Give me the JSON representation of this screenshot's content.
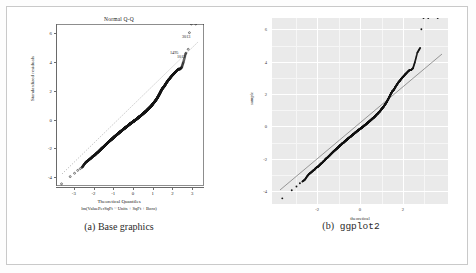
{
  "figure": {
    "panels": [
      {
        "id": "a",
        "caption_lead": "(a)",
        "caption_text": "Base graphics",
        "style": "base-r"
      },
      {
        "id": "b",
        "caption_lead": "(b)",
        "caption_text": "ggplot2",
        "style": "ggplot2"
      }
    ]
  },
  "chart_data": [
    {
      "type": "scatter",
      "panel": "a",
      "title": "Normal Q-Q",
      "xlabel": "Theoretical Quantiles",
      "sublabel": "lm(ValuePerSqFt ~ Units + SqFt + Boro)",
      "ylabel": "Standardized residuals",
      "xlim": [
        -3.9,
        3.6
      ],
      "ylim": [
        -4.6,
        6.6
      ],
      "xticks": [
        "-3",
        "-2",
        "-1",
        "0",
        "1",
        "2",
        "3"
      ],
      "xtick_values": [
        -3,
        -2,
        -1,
        0,
        1,
        2,
        3
      ],
      "yticks": [
        "-4",
        "-2",
        "0",
        "2",
        "4",
        "6"
      ],
      "ytick_values": [
        -4,
        -2,
        0,
        2,
        4,
        6
      ],
      "grid": false,
      "legend": "none",
      "reference_line": {
        "type": "qq-line",
        "style": "dotted",
        "slope": 1.0,
        "intercept": 0.0
      },
      "annotations": [
        {
          "label": "3013",
          "x": 3.15,
          "y": 6.0
        },
        {
          "label": "1495",
          "x": 2.98,
          "y": 4.85
        },
        {
          "label": "1012",
          "x": 2.86,
          "y": 4.55
        }
      ],
      "x": [
        -3.62,
        -3.18,
        -2.96,
        -2.8,
        -2.67,
        -2.56,
        -2.47,
        -2.38,
        -2.31,
        -2.24,
        -2.17,
        -2.11,
        -2.06,
        -2.0,
        -1.95,
        -1.9,
        -1.86,
        -1.81,
        -1.77,
        -1.73,
        -1.69,
        -1.65,
        -1.62,
        -1.58,
        -1.55,
        -1.51,
        -1.48,
        -1.45,
        -1.42,
        -1.39,
        -1.36,
        -1.33,
        -1.3,
        -1.27,
        -1.25,
        -1.22,
        -1.19,
        -1.17,
        -1.14,
        -1.11,
        -1.09,
        -1.06,
        -1.04,
        -1.01,
        -0.99,
        -0.97,
        -0.94,
        -0.92,
        -0.9,
        -0.87,
        -0.85,
        -0.83,
        -0.81,
        -0.78,
        -0.76,
        -0.74,
        -0.72,
        -0.7,
        -0.68,
        -0.66,
        -0.64,
        -0.61,
        -0.59,
        -0.57,
        -0.55,
        -0.53,
        -0.51,
        -0.49,
        -0.47,
        -0.45,
        -0.43,
        -0.41,
        -0.39,
        -0.37,
        -0.35,
        -0.33,
        -0.31,
        -0.29,
        -0.27,
        -0.25,
        -0.23,
        -0.21,
        -0.2,
        -0.18,
        -0.16,
        -0.14,
        -0.12,
        -0.1,
        -0.08,
        -0.06,
        -0.04,
        -0.02,
        0.0,
        0.02,
        0.04,
        0.06,
        0.08,
        0.1,
        0.12,
        0.14,
        0.16,
        0.18,
        0.2,
        0.21,
        0.23,
        0.25,
        0.27,
        0.29,
        0.31,
        0.33,
        0.35,
        0.37,
        0.39,
        0.41,
        0.43,
        0.45,
        0.47,
        0.49,
        0.51,
        0.53,
        0.55,
        0.57,
        0.59,
        0.61,
        0.64,
        0.66,
        0.68,
        0.7,
        0.72,
        0.74,
        0.76,
        0.78,
        0.81,
        0.83,
        0.85,
        0.87,
        0.9,
        0.92,
        0.94,
        0.97,
        0.99,
        1.01,
        1.04,
        1.06,
        1.09,
        1.11,
        1.14,
        1.17,
        1.19,
        1.22,
        1.25,
        1.27,
        1.3,
        1.33,
        1.36,
        1.39,
        1.42,
        1.45,
        1.48,
        1.51,
        1.55,
        1.58,
        1.62,
        1.65,
        1.69,
        1.73,
        1.77,
        1.81,
        1.86,
        1.9,
        1.95,
        2.0,
        2.06,
        2.11,
        2.17,
        2.24,
        2.31,
        2.38,
        2.47,
        2.56,
        2.67,
        2.8,
        2.86,
        2.96,
        3.18,
        3.62
      ],
      "y": [
        -4.45,
        -3.95,
        -3.72,
        -3.52,
        -3.4,
        -3.28,
        -3.1,
        -2.95,
        -2.88,
        -2.8,
        -2.72,
        -2.66,
        -2.58,
        -2.52,
        -2.48,
        -2.42,
        -2.36,
        -2.3,
        -2.26,
        -2.2,
        -2.15,
        -2.1,
        -2.05,
        -2.0,
        -1.96,
        -1.92,
        -1.88,
        -1.84,
        -1.8,
        -1.76,
        -1.72,
        -1.68,
        -1.64,
        -1.6,
        -1.57,
        -1.54,
        -1.5,
        -1.47,
        -1.44,
        -1.41,
        -1.38,
        -1.35,
        -1.32,
        -1.29,
        -1.26,
        -1.23,
        -1.2,
        -1.17,
        -1.15,
        -1.12,
        -1.09,
        -1.07,
        -1.04,
        -1.02,
        -0.99,
        -0.97,
        -0.94,
        -0.92,
        -0.89,
        -0.87,
        -0.85,
        -0.82,
        -0.8,
        -0.77,
        -0.75,
        -0.73,
        -0.71,
        -0.68,
        -0.66,
        -0.64,
        -0.62,
        -0.6,
        -0.57,
        -0.55,
        -0.53,
        -0.51,
        -0.49,
        -0.47,
        -0.45,
        -0.42,
        -0.4,
        -0.38,
        -0.36,
        -0.34,
        -0.32,
        -0.3,
        -0.28,
        -0.26,
        -0.24,
        -0.22,
        -0.2,
        -0.18,
        -0.16,
        -0.14,
        -0.12,
        -0.1,
        -0.08,
        -0.06,
        -0.04,
        -0.02,
        0.0,
        0.02,
        0.04,
        0.06,
        0.08,
        0.1,
        0.12,
        0.15,
        0.17,
        0.19,
        0.21,
        0.23,
        0.25,
        0.28,
        0.3,
        0.32,
        0.35,
        0.37,
        0.39,
        0.42,
        0.44,
        0.47,
        0.49,
        0.52,
        0.54,
        0.57,
        0.6,
        0.62,
        0.65,
        0.68,
        0.71,
        0.74,
        0.77,
        0.8,
        0.83,
        0.86,
        0.89,
        0.93,
        0.96,
        1.0,
        1.04,
        1.08,
        1.12,
        1.16,
        1.2,
        1.25,
        1.3,
        1.35,
        1.4,
        1.46,
        1.52,
        1.58,
        1.65,
        1.72,
        1.8,
        1.88,
        1.96,
        2.05,
        2.1,
        2.18,
        2.22,
        2.28,
        2.36,
        2.44,
        2.52,
        2.6,
        2.68,
        2.76,
        2.82,
        2.9,
        2.98,
        3.06,
        3.14,
        3.22,
        3.3,
        3.4,
        3.48,
        3.48,
        3.6,
        3.98,
        4.55,
        4.85,
        6.0
      ]
    },
    {
      "type": "scatter",
      "panel": "b",
      "title": "",
      "xlabel": "theoretical",
      "ylabel": "sample",
      "xlim": [
        -4.1,
        4.1
      ],
      "ylim": [
        -4.8,
        6.7
      ],
      "xticks": [
        "-2",
        "0",
        "2"
      ],
      "xtick_values": [
        -2,
        0,
        2
      ],
      "yticks": [
        "-4",
        "-2",
        "0",
        "2",
        "4",
        "6"
      ],
      "ytick_values": [
        -4,
        -2,
        0,
        2,
        4,
        6
      ],
      "grid": true,
      "grid_color": "#ffffff",
      "panel_background": "#eaeaea",
      "legend": "none",
      "reference_line": {
        "type": "qq-line",
        "style": "solid",
        "slope": 1.06,
        "intercept": 0.05
      }
    }
  ],
  "colors": {
    "point": "#1a1a1a",
    "gg_panel": "#eaeaea",
    "gg_grid_major": "#ffffff",
    "gg_grid_minor": "#f5f5f5",
    "axis": "#6a6a6a",
    "frame": "#c9c9c9",
    "text": "#1a1a1a"
  }
}
